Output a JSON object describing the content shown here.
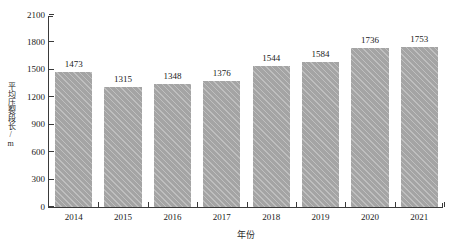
{
  "chart_data": {
    "type": "bar",
    "title": "",
    "xlabel": "年份",
    "ylabel": "平均压裂段长/m",
    "categories": [
      "2014",
      "2015",
      "2016",
      "2017",
      "2018",
      "2019",
      "2020",
      "2021"
    ],
    "values": [
      1473,
      1315,
      1348,
      1376,
      1544,
      1584,
      1736,
      1753
    ],
    "value_labels": [
      "1473",
      "1315",
      "1348",
      "1376",
      "1544",
      "1584",
      "1736",
      "1753"
    ],
    "ylim": [
      0,
      2100
    ],
    "ytick_values": [
      0,
      300,
      600,
      900,
      1200,
      1500,
      1800,
      2100
    ],
    "ytick_labels": [
      "0",
      "300",
      "600",
      "900",
      "1200",
      "1500",
      "1800",
      "2100"
    ],
    "grid": false,
    "legend": null,
    "series": [
      {
        "name": "平均压裂段长",
        "values": [
          1473,
          1315,
          1348,
          1376,
          1544,
          1584,
          1736,
          1753
        ],
        "color": "#adadad"
      }
    ],
    "colors": {
      "bar_fill": "#adadad",
      "axis": "#3a3a3a",
      "text": "#1a1a1a"
    }
  }
}
